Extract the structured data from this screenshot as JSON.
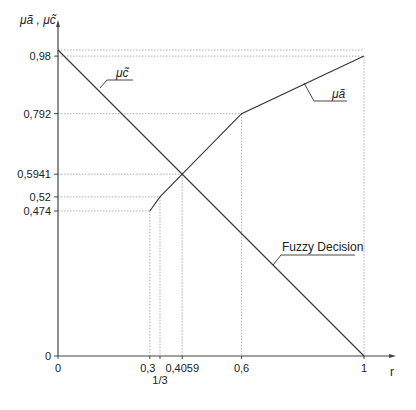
{
  "chart_data": {
    "type": "line",
    "title": "",
    "xlabel": "r",
    "ylabel": "μã , μc̃",
    "xlim": [
      0,
      1
    ],
    "ylim": [
      0,
      1
    ],
    "grid": false,
    "legend": "inline labels",
    "x_ticks": [
      {
        "value": 0,
        "label": "0"
      },
      {
        "value": 0.3,
        "label": "0,3"
      },
      {
        "value": 0.3333,
        "label": "1/3"
      },
      {
        "value": 0.4059,
        "label": "0,4059"
      },
      {
        "value": 0.6,
        "label": "0,6"
      },
      {
        "value": 1,
        "label": "1"
      }
    ],
    "y_ticks": [
      {
        "value": 0,
        "label": "0"
      },
      {
        "value": 0.474,
        "label": "0,474"
      },
      {
        "value": 0.52,
        "label": "0,52"
      },
      {
        "value": 0.5941,
        "label": "0,5941"
      },
      {
        "value": 0.792,
        "label": "0,792"
      },
      {
        "value": 0.98,
        "label": "0,98"
      }
    ],
    "series": [
      {
        "name": "μã",
        "x": [
          0.3,
          0.3333,
          0.4059,
          0.6,
          1
        ],
        "y": [
          0.474,
          0.52,
          0.5941,
          0.792,
          0.98
        ]
      },
      {
        "name": "μc̃",
        "x": [
          0,
          1
        ],
        "y": [
          1,
          0
        ]
      }
    ],
    "annotations": [
      {
        "text": "Fuzzy Decision",
        "points_to": {
          "x": 0.7,
          "y": 0.3
        }
      },
      {
        "text": "intersection",
        "x": 0.4059,
        "y": 0.5941
      }
    ]
  },
  "labels": {
    "y_axis": "μã , μc̃",
    "x_axis": "r",
    "mu_a": "μã",
    "mu_c": "μc̃",
    "fuzzy_decision": "Fuzzy Decision"
  }
}
